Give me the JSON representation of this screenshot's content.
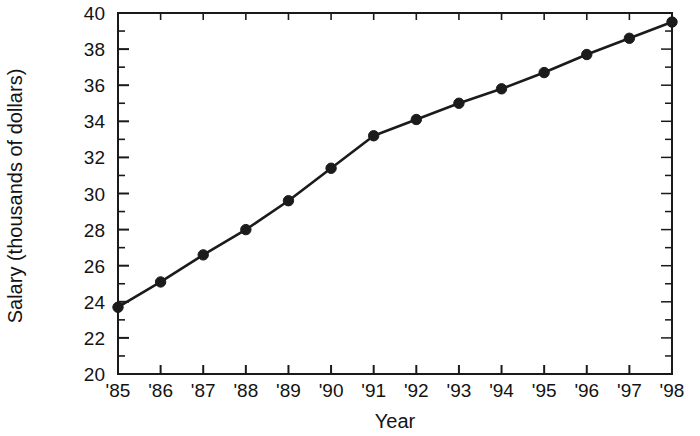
{
  "chart_data": {
    "type": "line",
    "title": "",
    "xlabel": "Year",
    "ylabel": "Salary (thousands of dollars)",
    "categories": [
      "'85",
      "'86",
      "'87",
      "'88",
      "'89",
      "'90",
      "'91",
      "'92",
      "'93",
      "'94",
      "'95",
      "'96",
      "'97",
      "'98"
    ],
    "x": [
      1985,
      1986,
      1987,
      1988,
      1989,
      1990,
      1991,
      1992,
      1993,
      1994,
      1995,
      1996,
      1997,
      1998
    ],
    "values": [
      23.7,
      25.1,
      26.6,
      28.0,
      29.6,
      31.4,
      33.2,
      34.1,
      35.0,
      35.8,
      36.7,
      37.7,
      38.6,
      39.5
    ],
    "series": [
      {
        "name": "Salary",
        "values": [
          23.7,
          25.1,
          26.6,
          28.0,
          29.6,
          31.4,
          33.2,
          34.1,
          35.0,
          35.8,
          36.7,
          37.7,
          38.6,
          39.5
        ]
      }
    ],
    "ylim": [
      20,
      40
    ],
    "ytick_labels": [
      "20",
      "22",
      "24",
      "26",
      "28",
      "30",
      "32",
      "34",
      "36",
      "38",
      "40"
    ],
    "ytick_values": [
      20,
      22,
      24,
      26,
      28,
      30,
      32,
      34,
      36,
      38,
      40
    ],
    "yminor_values": [
      21,
      23,
      25,
      27,
      29,
      31,
      33,
      35,
      37,
      39
    ],
    "xlim": [
      1985,
      1998
    ],
    "grid": false,
    "legend": "none",
    "marker": "filled-circle",
    "line_color": "#1b1b1b",
    "marker_color": "#1b1b1b",
    "axis_color": "#1a1a1a",
    "background": "#ffffff"
  }
}
